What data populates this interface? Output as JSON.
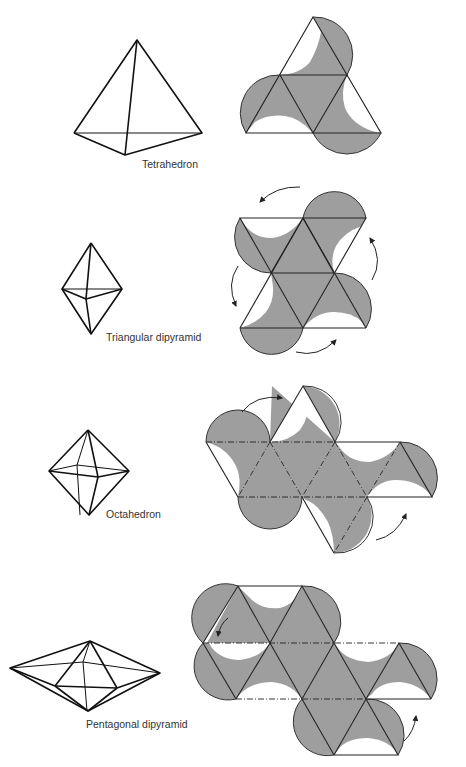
{
  "figure": {
    "rows": [
      {
        "solid": "Tetrahedron",
        "label": "Tetrahedron",
        "faces": 4,
        "net_rotation_arrows": 0
      },
      {
        "solid": "Triangular dipyramid",
        "label": "Triangular dipyramid",
        "faces": 6,
        "net_rotation_arrows": 4
      },
      {
        "solid": "Octahedron",
        "label": "Octahedron",
        "faces": 8,
        "net_rotation_arrows": 2
      },
      {
        "solid": "Pentagonal dipyramid",
        "label": "Pentagonal dipyramid",
        "faces": 10,
        "net_rotation_arrows": 2
      }
    ],
    "colors": {
      "shading": "#9e9e9e",
      "lines": "#222222",
      "background": "#ffffff"
    }
  }
}
